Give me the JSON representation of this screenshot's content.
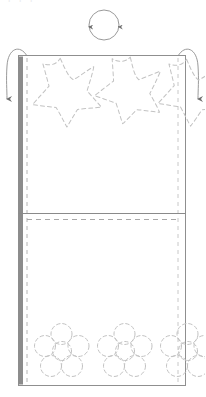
{
  "document": {
    "title": "Fabric panel fold pattern",
    "kind": "craft-pattern-diagram",
    "clipped_caption": "f f f"
  },
  "colors": {
    "outline": "#9a9a9a",
    "panel_fill": "#ffffff",
    "spine": "#8c8c8c",
    "dashed_guide": "#b8b8b8",
    "motif_stroke": "#bdbdbd",
    "arrow": "#9a9a9a",
    "background": "#ffffff",
    "fold_line": "#8a8a8a"
  },
  "canvas": {
    "width": 205,
    "height": 397
  },
  "panel": {
    "label": "fabric-panel",
    "x": 18,
    "y": 55,
    "width": 168,
    "height": 331,
    "spine": {
      "label": "bound-edge",
      "x": 18,
      "y": 56,
      "width": 5,
      "height": 329
    },
    "seam_guide_left": {
      "label": "left-seam-allowance-guide",
      "x": 27,
      "y_start": 58,
      "y_end": 383
    },
    "seam_guide_right": {
      "label": "right-seam-allowance-guide",
      "x": 178,
      "y_start": 58,
      "y_end": 383
    },
    "fold": {
      "label": "center-fold-line",
      "solid_y": 213,
      "dashed_y": 219
    }
  },
  "rotation_marker": {
    "label": "rotate-indicator",
    "cx": 104,
    "cy": 25,
    "r": 15,
    "arrowheads": [
      "left-down",
      "right-down"
    ]
  },
  "fold_arrows": [
    {
      "label": "fold-arrow-left",
      "side": "left",
      "direction": "down"
    },
    {
      "label": "fold-arrow-right",
      "side": "right",
      "direction": "down"
    }
  ],
  "motifs": {
    "top_row": {
      "label": "star-motif-row",
      "shape": "star",
      "points": 5,
      "count": 3,
      "stroke_style": "dashed",
      "items": [
        {
          "cx": 65,
          "cy": 92,
          "r": 34,
          "rotation": -8
        },
        {
          "cx": 128,
          "cy": 90,
          "r": 32,
          "rotation": 4
        },
        {
          "cx": 188,
          "cy": 92,
          "r": 32,
          "rotation": -6
        }
      ]
    },
    "bottom_row": {
      "label": "flower-motif-row",
      "shape": "flower",
      "petals": 5,
      "count": 3,
      "stroke_style": "dashed",
      "items": [
        {
          "cx": 62,
          "cy": 351,
          "r": 27
        },
        {
          "cx": 125,
          "cy": 351,
          "r": 27
        },
        {
          "cx": 186,
          "cy": 351,
          "r": 27
        }
      ]
    }
  }
}
